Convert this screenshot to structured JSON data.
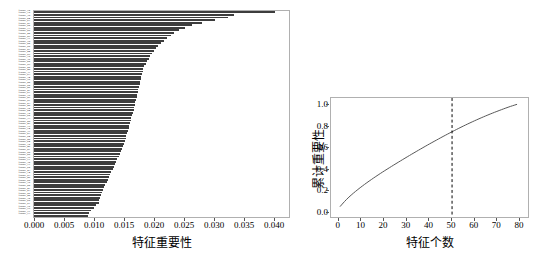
{
  "figure": {
    "background": "#ffffff",
    "bar_color": "#3d3d3d",
    "line_color": "#555555",
    "axis_color": "#b0b0b0"
  },
  "chart_data": [
    {
      "type": "bar",
      "orientation": "horizontal",
      "title": "",
      "xlabel": "特征重要性",
      "ylabel": "",
      "xlim": [
        0.0,
        0.0425
      ],
      "xticks": [
        "0.000",
        "0.005",
        "0.010",
        "0.015",
        "0.020",
        "0.025",
        "0.030",
        "0.035",
        "0.040"
      ],
      "xtick_values": [
        0.0,
        0.005,
        0.01,
        0.015,
        0.02,
        0.025,
        0.03,
        0.035,
        0.04
      ],
      "grid": false,
      "legend": "none",
      "categories": [
        "feature_72",
        "feature_15",
        "feature_38",
        "feature_04",
        "feature_61",
        "feature_27",
        "feature_50",
        "feature_13",
        "feature_66",
        "feature_42",
        "feature_09",
        "feature_31",
        "feature_78",
        "feature_22",
        "feature_55",
        "feature_07",
        "feature_44",
        "feature_69",
        "feature_18",
        "feature_36",
        "feature_02",
        "feature_59",
        "feature_25",
        "feature_48",
        "feature_11",
        "feature_63",
        "feature_34",
        "feature_76",
        "feature_20",
        "feature_52",
        "feature_06",
        "feature_41",
        "feature_67",
        "feature_16",
        "feature_29",
        "feature_57",
        "feature_03",
        "feature_45",
        "feature_70",
        "feature_24",
        "feature_12",
        "feature_60",
        "feature_33",
        "feature_08",
        "feature_49",
        "feature_19",
        "feature_74",
        "feature_37",
        "feature_01",
        "feature_54",
        "feature_28",
        "feature_64",
        "feature_10",
        "feature_46",
        "feature_21",
        "feature_58",
        "feature_05",
        "feature_39",
        "feature_71",
        "feature_30",
        "feature_17",
        "feature_62",
        "feature_43",
        "feature_14",
        "feature_53",
        "feature_26",
        "feature_68",
        "feature_35",
        "feature_00",
        "feature_47",
        "feature_23",
        "feature_56",
        "feature_40",
        "feature_32",
        "feature_65",
        "feature_51",
        "feature_75",
        "feature_79",
        "feature_77",
        "feature_73"
      ],
      "values": [
        0.0402,
        0.0333,
        0.0324,
        0.0301,
        0.028,
        0.0263,
        0.0252,
        0.0242,
        0.0234,
        0.0228,
        0.0222,
        0.0216,
        0.0211,
        0.0207,
        0.0203,
        0.02,
        0.0197,
        0.0194,
        0.0192,
        0.0189,
        0.0186,
        0.0184,
        0.0182,
        0.0181,
        0.018,
        0.0179,
        0.0178,
        0.0177,
        0.0176,
        0.0175,
        0.0174,
        0.0173,
        0.0172,
        0.0171,
        0.017,
        0.0169,
        0.0168,
        0.0167,
        0.0166,
        0.0165,
        0.0163,
        0.0162,
        0.0161,
        0.016,
        0.0159,
        0.0158,
        0.0157,
        0.0155,
        0.0154,
        0.0153,
        0.0151,
        0.015,
        0.0148,
        0.0147,
        0.0145,
        0.0143,
        0.0141,
        0.0139,
        0.0137,
        0.0135,
        0.0133,
        0.0131,
        0.0129,
        0.0127,
        0.0125,
        0.0123,
        0.0121,
        0.0119,
        0.0117,
        0.0115,
        0.0113,
        0.0111,
        0.011,
        0.0109,
        0.0108,
        0.0104,
        0.01,
        0.0095,
        0.0092,
        0.009
      ]
    },
    {
      "type": "line",
      "title": "",
      "xlabel": "特征个数",
      "ylabel": "累计重要性",
      "xlim": [
        -3,
        84
      ],
      "ylim": [
        -0.05,
        1.06
      ],
      "xticks": [
        "0",
        "10",
        "20",
        "30",
        "40",
        "50",
        "60",
        "70",
        "80"
      ],
      "xtick_values": [
        0,
        10,
        20,
        30,
        40,
        50,
        60,
        70,
        80
      ],
      "yticks": [
        "0.0",
        "0.2",
        "0.4",
        "0.6",
        "0.8",
        "1.0"
      ],
      "ytick_values": [
        0.0,
        0.2,
        0.4,
        0.6,
        0.8,
        1.0
      ],
      "grid": false,
      "legend": "none",
      "annotations": [
        {
          "name": "threshold-line",
          "kind": "vline",
          "x": 51,
          "style": "dashed",
          "color": "#000000",
          "label": "51"
        }
      ],
      "x": [
        1,
        2,
        3,
        4,
        5,
        6,
        7,
        8,
        9,
        10,
        11,
        12,
        13,
        14,
        15,
        16,
        17,
        18,
        19,
        20,
        21,
        22,
        23,
        24,
        25,
        26,
        27,
        28,
        29,
        30,
        31,
        32,
        33,
        34,
        35,
        36,
        37,
        38,
        39,
        40,
        41,
        42,
        43,
        44,
        45,
        46,
        47,
        48,
        49,
        50,
        51,
        52,
        53,
        54,
        55,
        56,
        57,
        58,
        59,
        60,
        61,
        62,
        63,
        64,
        65,
        66,
        67,
        68,
        69,
        70,
        71,
        72,
        73,
        74,
        75,
        76,
        77,
        78,
        79,
        80
      ],
      "y": [
        0.04,
        0.073,
        0.106,
        0.136,
        0.164,
        0.19,
        0.215,
        0.239,
        0.263,
        0.286,
        0.308,
        0.329,
        0.351,
        0.371,
        0.392,
        0.412,
        0.431,
        0.451,
        0.47,
        0.489,
        0.508,
        0.526,
        0.544,
        0.562,
        0.58,
        0.598,
        0.616,
        0.634,
        0.651,
        0.668,
        0.686,
        0.703,
        0.72,
        0.737,
        0.754,
        0.771,
        0.788,
        0.805,
        0.821,
        0.838,
        0.854,
        0.87,
        0.886,
        0.902,
        0.918,
        0.934,
        0.95,
        0.965,
        0.981,
        0.996,
        0.9,
        0.912,
        0.923,
        0.933,
        0.942,
        0.951,
        0.958,
        0.965,
        0.971,
        0.976,
        0.98,
        0.984,
        0.987,
        0.99,
        0.992,
        0.994,
        0.995,
        0.996,
        0.997,
        0.998,
        0.9985,
        0.999,
        0.9993,
        0.9995,
        0.9997,
        0.9998,
        0.9999,
        0.99995,
        0.99998,
        1.0
      ]
    }
  ]
}
